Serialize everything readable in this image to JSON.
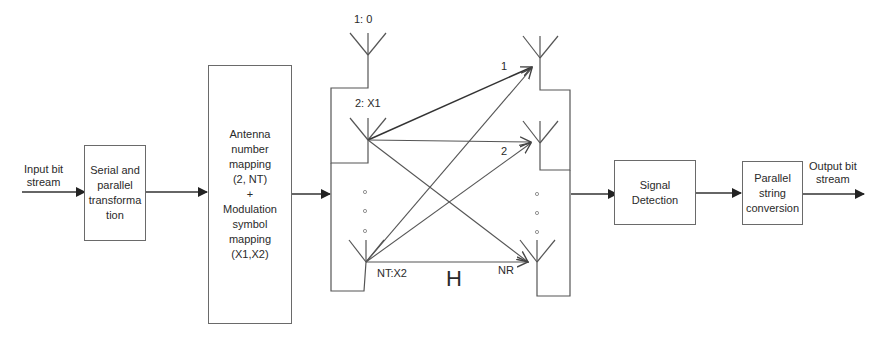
{
  "diagram": {
    "input_label": [
      "Input bit",
      "stream"
    ],
    "output_label": [
      "Output bit",
      "stream"
    ],
    "blocks": [
      {
        "id": "serial-parallel",
        "lines": [
          "Serial and",
          "parallel",
          "transforma",
          "tion"
        ]
      },
      {
        "id": "mapping",
        "lines": [
          "Antenna",
          "number",
          "mapping",
          "(2, NT)",
          "+",
          "Modulation",
          "symbol",
          "mapping",
          "(X1,X2)"
        ]
      },
      {
        "id": "signal-detection",
        "lines": [
          "Signal",
          "Detection"
        ]
      },
      {
        "id": "parallel-string",
        "lines": [
          "Parallel",
          "string",
          "conversion"
        ]
      }
    ],
    "tx_antennas": [
      {
        "label": "1: 0"
      },
      {
        "label": "2: X1"
      },
      {
        "label": "NT:X2"
      }
    ],
    "rx_antennas": [
      {
        "label": "1"
      },
      {
        "label": "2"
      },
      {
        "label": "NR"
      }
    ],
    "channel_label": "H",
    "ellipsis_dots": "o",
    "colors": {
      "line": "#555555",
      "arrow": "#222222",
      "text": "#2a2a2a",
      "box_border": "#6a6a6a"
    }
  }
}
